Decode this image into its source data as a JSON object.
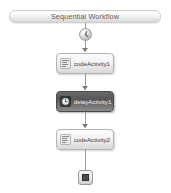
{
  "designer": {
    "name": "sequential-workflow-designer",
    "background_color": "#ffffff"
  },
  "header": {
    "title": "Sequential Workflow",
    "text_color": "#595959",
    "border_color": "#cfcfcf"
  },
  "nodes": {
    "start": {
      "icon": "start-clock-icon",
      "label": ""
    },
    "end": {
      "icon": "stop-square-icon",
      "label": ""
    }
  },
  "activities": [
    {
      "id": "code-activity-1",
      "label": "codeActivity1",
      "icon": "code-activity-icon",
      "selected": false,
      "type": "CodeActivity"
    },
    {
      "id": "delay-activity-1",
      "label": "delayActivity1",
      "icon": "delay-activity-icon",
      "selected": true,
      "type": "DelayActivity"
    },
    {
      "id": "code-activity-2",
      "label": "codeActivity2",
      "icon": "code-activity-icon",
      "selected": false,
      "type": "CodeActivity"
    }
  ],
  "colors": {
    "connector": "#9a9a9a",
    "arrowhead": "#7b7b7b",
    "activity_border": "#b4b4b4",
    "selected_fill": "#565656"
  }
}
